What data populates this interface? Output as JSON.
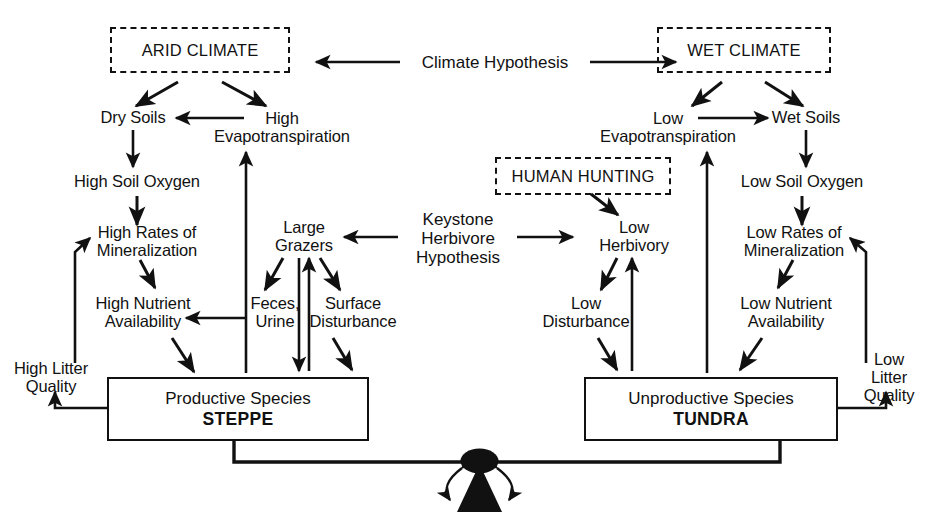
{
  "diagram": {
    "ink_color": "#111111",
    "background": "#ffffff"
  },
  "climate": {
    "left_box": "ARID CLIMATE",
    "right_box": "WET CLIMATE",
    "hypothesis_label": "Climate Hypothesis"
  },
  "herbivore": {
    "hypothesis_label": "Keystone\nHerbivore\nHypothesis",
    "human_hunting_box": "HUMAN HUNTING"
  },
  "left_chain": {
    "dry_soils": "Dry Soils",
    "high_evapotranspiration": "High\nEvapotranspiration",
    "high_soil_oxygen": "High Soil Oxygen",
    "high_rates_mineralization": "High Rates of\nMineralization",
    "high_nutrient_availability": "High Nutrient\nAvailability",
    "high_litter_quality": "High Litter\nQuality",
    "large_grazers": "Large\nGrazers",
    "feces_urine": "Feces,\nUrine",
    "surface_disturbance": "Surface\nDisturbance",
    "box_line1": "Productive Species",
    "box_line2": "STEPPE"
  },
  "right_chain": {
    "wet_soils": "Wet Soils",
    "low_evapotranspiration": "Low\nEvapotranspiration",
    "low_soil_oxygen": "Low Soil Oxygen",
    "low_rates_mineralization": "Low Rates of\nMineralization",
    "low_nutrient_availability": "Low Nutrient\nAvailability",
    "low_litter_quality": "Low Litter\nQuality",
    "low_herbivory": "Low\nHerbivory",
    "low_disturbance": "Low\nDisturbance",
    "box_line1": "Unproductive Species",
    "box_line2": "TUNDRA"
  },
  "balance": {
    "fulcrum_name": "seesaw-fulcrum",
    "beam_name": "balance-beam"
  }
}
